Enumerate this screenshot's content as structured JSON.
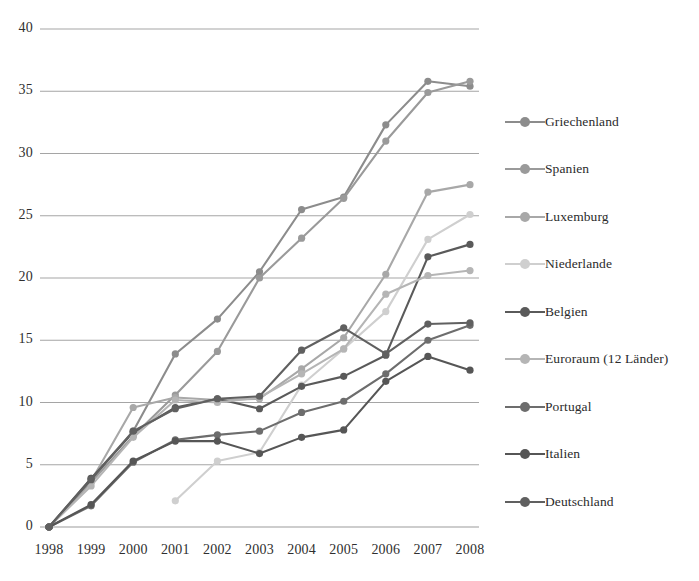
{
  "chart_data": {
    "type": "line",
    "title": "",
    "subtitle": "",
    "xlabel": "",
    "ylabel": "",
    "x": [
      1998,
      1999,
      2000,
      2001,
      2002,
      2003,
      2004,
      2005,
      2006,
      2007,
      2008
    ],
    "categories": [
      "1998",
      "1999",
      "2000",
      "2001",
      "2002",
      "2003",
      "2004",
      "2005",
      "2006",
      "2007",
      "2008"
    ],
    "xlim": [
      1998,
      2008
    ],
    "ylim": [
      0,
      40
    ],
    "yticks": [
      0,
      5,
      10,
      15,
      20,
      25,
      30,
      35,
      40
    ],
    "ytick_labels": [
      "0",
      "5",
      "10",
      "15",
      "20",
      "25",
      "30",
      "35",
      "40"
    ],
    "grid": "horizontal",
    "legend_position": "right",
    "series": [
      {
        "name": "Griechenland",
        "color": "#8c8c8c",
        "values": [
          0,
          3.9,
          7.7,
          13.9,
          16.7,
          20.5,
          25.5,
          26.5,
          32.3,
          35.8,
          35.4
        ]
      },
      {
        "name": "Spanien",
        "color": "#9a9a9a",
        "values": [
          0,
          3.6,
          7.3,
          10.6,
          14.1,
          20.0,
          23.2,
          26.4,
          31.0,
          34.9,
          35.8
        ]
      },
      {
        "name": "Luxemburg",
        "color": "#a8a8a8",
        "values": [
          0,
          3.7,
          9.6,
          10.4,
          10.2,
          10.3,
          12.7,
          15.2,
          20.3,
          26.9,
          27.5
        ]
      },
      {
        "name": "Niederlande",
        "color": "#cfcfcf",
        "values": [
          null,
          null,
          null,
          2.1,
          5.3,
          6.0,
          11.4,
          14.3,
          17.3,
          23.1,
          25.1
        ]
      },
      {
        "name": "Belgien",
        "color": "#5a5a5a",
        "values": [
          0,
          3.9,
          7.6,
          9.6,
          10.3,
          9.5,
          11.3,
          12.1,
          13.8,
          21.7,
          22.7
        ]
      },
      {
        "name": "Euroraum (12 Länder)",
        "color": "#b5b5b5",
        "values": [
          0,
          3.3,
          7.2,
          10.2,
          10.0,
          10.4,
          12.3,
          14.3,
          18.7,
          20.2,
          20.6
        ]
      },
      {
        "name": "Portugal",
        "color": "#6d6d6d",
        "values": [
          0,
          1.7,
          5.2,
          7.0,
          7.4,
          7.7,
          9.2,
          10.1,
          12.3,
          15.0,
          16.2
        ]
      },
      {
        "name": "Italien",
        "color": "#565656",
        "values": [
          0,
          1.8,
          5.3,
          6.9,
          6.9,
          5.9,
          7.2,
          7.8,
          11.7,
          13.7,
          12.6
        ]
      },
      {
        "name": "Deutschland",
        "color": "#606060",
        "values": [
          0,
          3.8,
          7.7,
          9.5,
          10.3,
          10.5,
          14.2,
          16.0,
          13.9,
          16.3,
          16.4
        ]
      }
    ]
  },
  "legend": {
    "items": [
      {
        "label": "Griechenland"
      },
      {
        "label": "Spanien"
      },
      {
        "label": "Luxemburg"
      },
      {
        "label": "Niederlande"
      },
      {
        "label": "Belgien"
      },
      {
        "label": "Euroraum (12 Länder)"
      },
      {
        "label": "Portugal"
      },
      {
        "label": "Italien"
      },
      {
        "label": "Deutschland"
      }
    ]
  },
  "axes": {
    "y_tick_labels": [
      "40",
      "35",
      "30",
      "25",
      "20",
      "15",
      "10",
      "5",
      "0"
    ],
    "x_tick_labels": [
      "1998",
      "1999",
      "2000",
      "2001",
      "2002",
      "2003",
      "2004",
      "2005",
      "2006",
      "2007",
      "2008"
    ]
  }
}
